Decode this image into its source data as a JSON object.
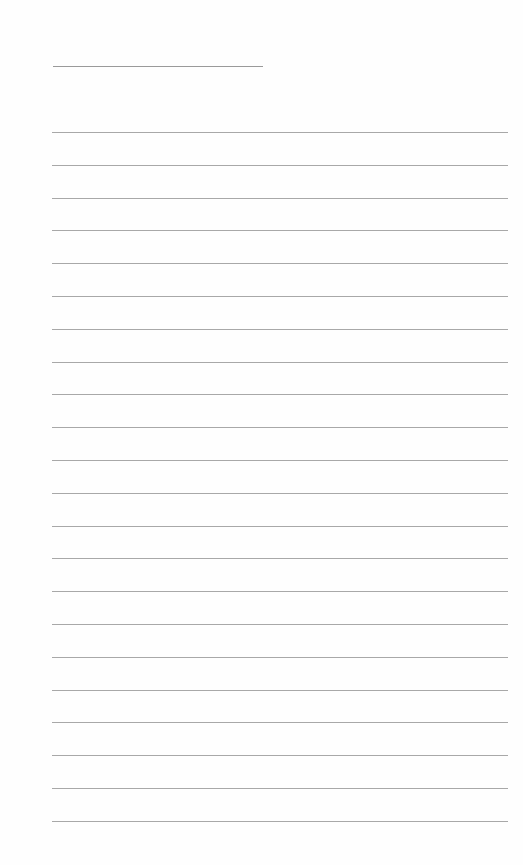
{
  "page": {
    "type": "lined-paper",
    "background": "#ffffff",
    "line_color": "#a8a8a8",
    "title_line": {
      "x": 53,
      "y": 66,
      "width": 210
    },
    "rules": {
      "count": 22,
      "x": 52,
      "width": 456,
      "first_y": 132,
      "spacing": 32.8
    }
  }
}
